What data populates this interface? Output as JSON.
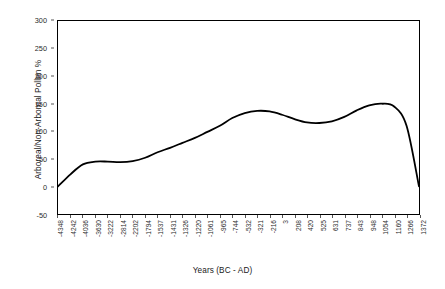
{
  "chart_data": {
    "type": "line",
    "title": "",
    "xlabel": "Years (BC - AD)",
    "ylabel": "Arboreal/Non-Arboreal Pollen %",
    "ylim": [
      -50,
      300
    ],
    "yticks": [
      -50,
      0,
      50,
      100,
      150,
      200,
      250,
      300
    ],
    "ytick_labels": [
      "-50",
      "0",
      "50",
      "100",
      "150",
      "200",
      "250",
      "300"
    ],
    "grid": false,
    "legend": "none",
    "line_color": "#000000",
    "line_width": 1.8,
    "categories": [
      "-4348",
      "-4242",
      "-4036",
      "-3630",
      "-3222",
      "-2814",
      "-2202",
      "-1794",
      "-1537",
      "-1431",
      "-1326",
      "-1220",
      "-1061",
      "-965",
      "-744",
      "-532",
      "-321",
      "-216",
      "3",
      "208",
      "420",
      "525",
      "631",
      "737",
      "843",
      "948",
      "1054",
      "1160",
      "1266",
      "1372"
    ],
    "values": [
      0,
      22,
      40,
      45,
      45,
      44,
      46,
      52,
      62,
      70,
      79,
      88,
      99,
      110,
      124,
      133,
      137,
      136,
      130,
      122,
      116,
      115,
      118,
      126,
      138,
      147,
      150,
      145,
      110,
      0
    ],
    "xtick_labels": [
      "-4348",
      "-4242",
      "-4036",
      "-3630",
      "-3222",
      "-2814",
      "-2202",
      "-1794",
      "-1537",
      "-1431",
      "-1326",
      "-1220",
      "-1061",
      "-965",
      "-744",
      "-532",
      "-321",
      "-216",
      "3",
      "208",
      "420",
      "525",
      "631",
      "737",
      "843",
      "948",
      "1054",
      "1160",
      "1266",
      "1372"
    ]
  }
}
